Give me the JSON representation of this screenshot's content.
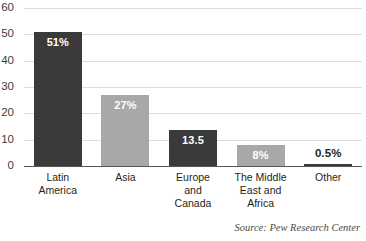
{
  "chart_data": {
    "type": "bar",
    "title": "",
    "xlabel": "",
    "ylabel": "",
    "ylim": [
      0,
      60
    ],
    "grid": true,
    "legend": "none",
    "categories": [
      "Latin America",
      "Asia",
      "Europe and Canada",
      "The Middle East and Africa",
      "Other"
    ],
    "category_lines": [
      [
        "Latin",
        "America"
      ],
      [
        "Asia"
      ],
      [
        "Europe",
        "and",
        "Canada"
      ],
      [
        "The Middle",
        "East and",
        "Africa"
      ],
      [
        "Other"
      ]
    ],
    "values": [
      51,
      27,
      13.5,
      8,
      0.5
    ],
    "data_labels": [
      "51%",
      "27%",
      "13.5",
      "8%",
      "0.5%"
    ],
    "label_placement": [
      "inside",
      "inside",
      "inside",
      "inside",
      "outside"
    ],
    "bar_colors": [
      "#3a3a3a",
      "#a8a8a8",
      "#3a3a3a",
      "#a8a8a8",
      "#3a3a3a"
    ],
    "ytick_labels": [
      "60",
      "50",
      "40",
      "30",
      "20",
      "10",
      "0"
    ],
    "ytick_values": [
      60,
      50,
      40,
      30,
      20,
      10,
      0
    ],
    "annotations": [
      "Source: Pew Research Center"
    ]
  },
  "title_remnant": "",
  "source": {
    "text": "Source: Pew Research Center"
  },
  "colors": {
    "bar_dark": "#3a3a3a",
    "bar_gray": "#a8a8a8",
    "gridline": "#dcdcdc",
    "axis": "#56565a",
    "text": "#231f20"
  }
}
